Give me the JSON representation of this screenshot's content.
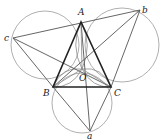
{
  "figure": {
    "title": "",
    "points": {
      "A": {
        "x": 81,
        "y": 22,
        "label": "A"
      },
      "B": {
        "x": 53,
        "y": 87,
        "label": "B"
      },
      "C": {
        "x": 111,
        "y": 87,
        "label": "C"
      },
      "O": {
        "x": 82,
        "y": 69,
        "label": "O"
      },
      "a": {
        "x": 90,
        "y": 131,
        "label": "a"
      },
      "b": {
        "x": 140,
        "y": 10,
        "label": "b"
      },
      "c": {
        "x": 13,
        "y": 38,
        "label": "c"
      }
    },
    "labels": [
      {
        "id": "A",
        "text": "A",
        "x": 78,
        "y": 15
      },
      {
        "id": "b",
        "text": "b",
        "x": 142,
        "y": 13
      },
      {
        "id": "c",
        "text": "c",
        "x": 4,
        "y": 41
      },
      {
        "id": "O",
        "text": "O",
        "x": 79,
        "y": 81
      },
      {
        "id": "B",
        "text": "B",
        "x": 43,
        "y": 96
      },
      {
        "id": "C",
        "text": "C",
        "x": 114,
        "y": 96
      },
      {
        "id": "a",
        "text": "a",
        "x": 87,
        "y": 139
      }
    ],
    "triangle": [
      "A",
      "B",
      "C"
    ],
    "segments": [
      [
        "c",
        "b"
      ],
      [
        "c",
        "B"
      ],
      [
        "c",
        "C"
      ],
      [
        "b",
        "C"
      ],
      [
        "b",
        "B"
      ],
      [
        "a",
        "B"
      ],
      [
        "a",
        "C"
      ],
      [
        "a",
        "A"
      ],
      [
        "A",
        "O"
      ],
      [
        "B",
        "O"
      ],
      [
        "C",
        "O"
      ]
    ],
    "circles": [
      {
        "name": "circle-cAB",
        "cx": 45,
        "cy": 45,
        "r": 34
      },
      {
        "name": "circle-AbC",
        "cx": 122,
        "cy": 45,
        "r": 37
      },
      {
        "name": "circle-BaC",
        "cx": 82,
        "cy": 103,
        "r": 30
      }
    ]
  }
}
